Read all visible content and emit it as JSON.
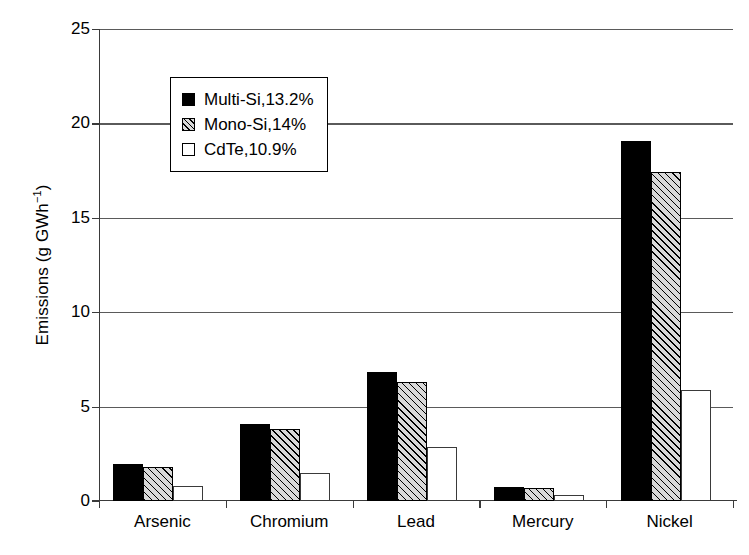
{
  "chart_data": {
    "type": "bar",
    "title": "",
    "xlabel": "",
    "ylabel": "Emissions (g GWh",
    "ylabel_sup": "−1",
    "ylabel_tail": ")",
    "categories": [
      "Arsenic",
      "Chromium",
      "Lead",
      "Mercury",
      "Nickel"
    ],
    "series": [
      {
        "name": "Multi-Si,13.2%",
        "pattern": "solid-black",
        "values": [
          1.95,
          4.1,
          6.85,
          0.75,
          19.05
        ]
      },
      {
        "name": "Mono-Si,14%",
        "pattern": "hatched",
        "values": [
          1.8,
          3.8,
          6.3,
          0.7,
          17.45
        ]
      },
      {
        "name": "CdTe,10.9%",
        "pattern": "white",
        "values": [
          0.8,
          1.5,
          2.85,
          0.3,
          5.9
        ]
      }
    ],
    "ylim": [
      0,
      25
    ],
    "yticks": [
      0,
      5,
      10,
      15,
      20,
      25
    ],
    "ytick_labels": [
      "0",
      "5",
      "10",
      "15",
      "20",
      "25"
    ],
    "grid": true,
    "legend_position": "upper-left-inside"
  },
  "legend": {
    "items": [
      {
        "label": "Multi-Si,13.2%",
        "swatch": "filled-black-square-icon"
      },
      {
        "label": "Mono-Si,14%",
        "swatch": "hatched-square-icon"
      },
      {
        "label": "CdTe,10.9%",
        "swatch": "empty-square-icon"
      }
    ]
  }
}
